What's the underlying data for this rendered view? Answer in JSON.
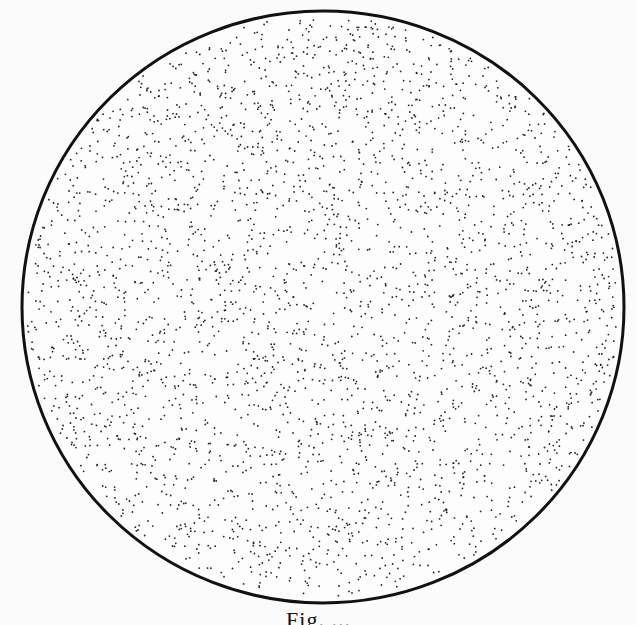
{
  "figure": {
    "circle": {
      "cx": 323,
      "cy": 307,
      "rx": 301,
      "ry": 296,
      "stroke": "#111111",
      "stroke_width": 3,
      "fill": "#fdfdfd"
    },
    "stipple": {
      "dot_color": "#222222",
      "dot_radius": 0.9,
      "dot_count": 3200,
      "seed": 7
    },
    "background": "#fbfbfb"
  },
  "caption": {
    "text": "Fig. ..."
  }
}
